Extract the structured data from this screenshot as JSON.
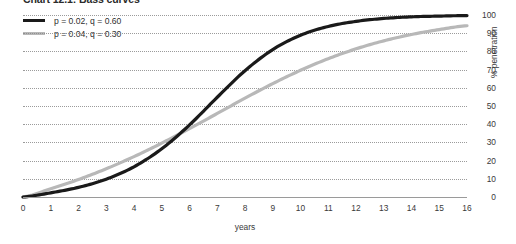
{
  "title": "Chart 12.1: Bass curves",
  "legend": {
    "position": "top-left",
    "entries": [
      {
        "label": "p = 0.02, q = 0.60",
        "color": "#1a1a1a"
      },
      {
        "label": "p = 0.04, q = 0.30",
        "color": "#b8b8b8"
      }
    ]
  },
  "axes": {
    "x_title": "years",
    "y_title": "% penetration",
    "x_ticks": [
      "0",
      "1",
      "2",
      "3",
      "4",
      "5",
      "6",
      "7",
      "8",
      "9",
      "10",
      "11",
      "12",
      "13",
      "14",
      "15",
      "16"
    ],
    "y_ticks": [
      "0",
      "10",
      "20",
      "30",
      "40",
      "50",
      "60",
      "70",
      "80",
      "90",
      "100"
    ]
  },
  "chart_data": {
    "type": "line",
    "title": "Chart 12.1: Bass curves",
    "xlabel": "years",
    "ylabel": "% penetration",
    "xlim": [
      0,
      16
    ],
    "ylim": [
      0,
      100
    ],
    "grid": true,
    "legend_position": "top-left",
    "x": [
      0,
      1,
      2,
      3,
      4,
      5,
      6,
      7,
      8,
      9,
      10,
      11,
      12,
      13,
      14,
      15,
      16
    ],
    "series": [
      {
        "name": "p = 0.02, q = 0.60",
        "color": "#1a1a1a",
        "p": 0.02,
        "q": 0.6,
        "values": [
          0,
          2.3,
          5.3,
          9.8,
          16.6,
          26.5,
          39.6,
          54.8,
          69.4,
          81.0,
          88.9,
          93.7,
          96.5,
          98.1,
          99.0,
          99.4,
          99.7
        ]
      },
      {
        "name": "p = 0.04, q = 0.30",
        "color": "#b8b8b8",
        "p": 0.04,
        "q": 0.3,
        "values": [
          0,
          4.5,
          9.6,
          15.5,
          22.2,
          29.6,
          37.6,
          45.9,
          54.3,
          62.3,
          69.6,
          76.0,
          81.4,
          85.8,
          89.3,
          92.0,
          94.1
        ]
      }
    ]
  }
}
